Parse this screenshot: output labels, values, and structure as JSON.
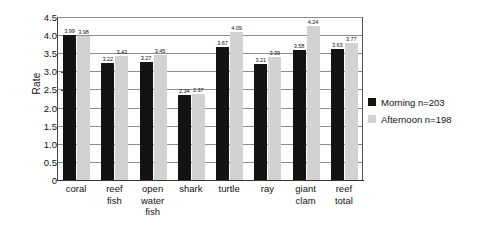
{
  "chart_data": {
    "type": "bar",
    "title": "",
    "xlabel": "",
    "ylabel": "Rate",
    "ylim": [
      0,
      4.5
    ],
    "yticks": [
      "0",
      "0.5",
      "1.0",
      "1.5",
      "2.0",
      "2.5",
      "3.0",
      "3.5",
      "4.0",
      "4.5"
    ],
    "grid": true,
    "legend_position": "right",
    "categories": [
      "coral",
      "reef fish",
      "open water fish",
      "shark",
      "turtle",
      "ray",
      "giant clam",
      "reef total"
    ],
    "category_lines": [
      [
        "coral"
      ],
      [
        "reef",
        "fish"
      ],
      [
        "open",
        "water",
        "fish"
      ],
      [
        "shark"
      ],
      [
        "turtle"
      ],
      [
        "ray"
      ],
      [
        "giant",
        "clam"
      ],
      [
        "reef",
        "total"
      ]
    ],
    "series": [
      {
        "name": "Morning n=203",
        "color": "#131313",
        "values": [
          3.99,
          3.22,
          3.27,
          2.34,
          3.67,
          3.21,
          3.58,
          3.63
        ],
        "labels": [
          "3.99",
          "3.22",
          "3.27",
          "2.34",
          "3.67",
          "3.21",
          "3.58",
          "3.63"
        ]
      },
      {
        "name": "Afternoon n=198",
        "color": "#d2d2d2",
        "values": [
          3.98,
          3.43,
          3.45,
          2.37,
          4.09,
          3.39,
          4.24,
          3.77
        ],
        "labels": [
          "3.98",
          "3.43",
          "3.45",
          "2.37",
          "4.09",
          "3.39",
          "4.24",
          "3.77"
        ]
      }
    ]
  },
  "legend": {
    "items": [
      {
        "label": "Morning n=203",
        "color": "#131313"
      },
      {
        "label": "Afternoon n=198",
        "color": "#d2d2d2"
      }
    ]
  },
  "axis": {
    "y_title": "Rate"
  }
}
